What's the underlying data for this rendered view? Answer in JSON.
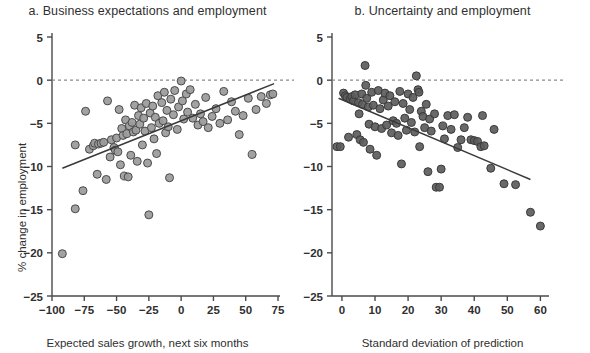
{
  "figure": {
    "background": "#ffffff",
    "panels": [
      {
        "key": "a",
        "title": "a. Business expectations and employment",
        "xlabel": "Expected sales growth, next six months",
        "ylabel": "% change in employment",
        "point_fill": "#9a9a9a",
        "point_stroke": "#4a4a4a",
        "line_color": "#3a3a3a",
        "zero_line_color": "#8a8a8a"
      },
      {
        "key": "b",
        "title": "b. Uncertainty and employment",
        "xlabel": "Standard deviation of prediction",
        "ylabel": "% change in employment",
        "point_fill": "#5c5c5c",
        "point_stroke": "#3a3a3a",
        "line_color": "#3a3a3a",
        "zero_line_color": "#8a8a8a"
      }
    ]
  },
  "chart_data": [
    {
      "type": "scatter",
      "panel": "a",
      "title": "a. Business expectations and employment",
      "xlabel": "Expected sales growth, next six months",
      "ylabel": "% change in employment",
      "xlim": [
        -100,
        75
      ],
      "ylim": [
        -25,
        5
      ],
      "xticks": [
        -100,
        -75,
        -50,
        -25,
        0,
        25,
        50,
        75
      ],
      "yticks": [
        5,
        0,
        -5,
        -10,
        -15,
        -20,
        -25
      ],
      "xticklabels": [
        "-100",
        "-75",
        "-50",
        "-25",
        "0",
        "25",
        "50",
        "75"
      ],
      "yticklabels": [
        "5",
        "0",
        "-5",
        "-10",
        "-15",
        "-20",
        "-25"
      ],
      "grid": false,
      "legend": null,
      "zero_reference_line": {
        "y": 0,
        "style": "dashed"
      },
      "trend_line": {
        "x": [
          -92,
          72
        ],
        "y": [
          -10.2,
          -0.4
        ],
        "style": "solid"
      },
      "points": [
        {
          "x": -92,
          "y": -20.1
        },
        {
          "x": -82,
          "y": -14.9
        },
        {
          "x": -82,
          "y": -7.5
        },
        {
          "x": -76,
          "y": -12.8
        },
        {
          "x": -74,
          "y": -3.6
        },
        {
          "x": -71,
          "y": -8.0
        },
        {
          "x": -68,
          "y": -7.6
        },
        {
          "x": -67,
          "y": -7.3
        },
        {
          "x": -65,
          "y": -10.9
        },
        {
          "x": -64,
          "y": -7.4
        },
        {
          "x": -62,
          "y": -7.3
        },
        {
          "x": -60,
          "y": -7.2
        },
        {
          "x": -58,
          "y": -11.5
        },
        {
          "x": -57,
          "y": -2.4
        },
        {
          "x": -55,
          "y": -8.9
        },
        {
          "x": -54,
          "y": -6.9
        },
        {
          "x": -52,
          "y": -7.8
        },
        {
          "x": -51,
          "y": -8.1
        },
        {
          "x": -50,
          "y": -6.7
        },
        {
          "x": -49,
          "y": -8.3
        },
        {
          "x": -48,
          "y": -3.4
        },
        {
          "x": -47,
          "y": -9.8
        },
        {
          "x": -46,
          "y": -5.6
        },
        {
          "x": -45,
          "y": -6.4
        },
        {
          "x": -44,
          "y": -11.1
        },
        {
          "x": -43,
          "y": -4.6
        },
        {
          "x": -42,
          "y": -6.2
        },
        {
          "x": -41,
          "y": -11.2
        },
        {
          "x": -40,
          "y": -5.3
        },
        {
          "x": -39,
          "y": -8.7
        },
        {
          "x": -38,
          "y": -4.9
        },
        {
          "x": -37,
          "y": -6.0
        },
        {
          "x": -36,
          "y": -2.9
        },
        {
          "x": -35,
          "y": -5.8
        },
        {
          "x": -34,
          "y": -9.4
        },
        {
          "x": -33,
          "y": -4.1
        },
        {
          "x": -32,
          "y": -5.1
        },
        {
          "x": -31,
          "y": -3.2
        },
        {
          "x": -30,
          "y": -7.5
        },
        {
          "x": -29,
          "y": -4.4
        },
        {
          "x": -28,
          "y": -5.9
        },
        {
          "x": -27,
          "y": -2.7
        },
        {
          "x": -26,
          "y": -9.6
        },
        {
          "x": -25,
          "y": -15.6
        },
        {
          "x": -24,
          "y": -3.8
        },
        {
          "x": -23,
          "y": -5.5
        },
        {
          "x": -22,
          "y": -3.0
        },
        {
          "x": -21,
          "y": -6.8
        },
        {
          "x": -20,
          "y": -4.3
        },
        {
          "x": -19,
          "y": -8.5
        },
        {
          "x": -18,
          "y": -1.8
        },
        {
          "x": -17,
          "y": -5.0
        },
        {
          "x": -15,
          "y": -2.6
        },
        {
          "x": -14,
          "y": -4.7
        },
        {
          "x": -13,
          "y": -1.4
        },
        {
          "x": -12,
          "y": -6.1
        },
        {
          "x": -11,
          "y": -3.5
        },
        {
          "x": -10,
          "y": -5.4
        },
        {
          "x": -9,
          "y": -11.3
        },
        {
          "x": -8,
          "y": -2.2
        },
        {
          "x": -6,
          "y": -4.0
        },
        {
          "x": -5,
          "y": -1.2
        },
        {
          "x": -3,
          "y": -5.7
        },
        {
          "x": -2,
          "y": -3.1
        },
        {
          "x": 0,
          "y": -0.1
        },
        {
          "x": 1,
          "y": -2.4
        },
        {
          "x": 2,
          "y": -4.5
        },
        {
          "x": 4,
          "y": -1.6
        },
        {
          "x": 5,
          "y": -3.7
        },
        {
          "x": 7,
          "y": -1.1
        },
        {
          "x": 9,
          "y": -4.4
        },
        {
          "x": 11,
          "y": -2.8
        },
        {
          "x": 13,
          "y": -5.2
        },
        {
          "x": 15,
          "y": -3.9
        },
        {
          "x": 17,
          "y": -4.8
        },
        {
          "x": 19,
          "y": -2.0
        },
        {
          "x": 21,
          "y": -5.5
        },
        {
          "x": 24,
          "y": -4.2
        },
        {
          "x": 27,
          "y": -3.3
        },
        {
          "x": 30,
          "y": -5.0
        },
        {
          "x": 33,
          "y": -1.3
        },
        {
          "x": 36,
          "y": -4.6
        },
        {
          "x": 39,
          "y": -2.5
        },
        {
          "x": 42,
          "y": -3.6
        },
        {
          "x": 45,
          "y": -6.3
        },
        {
          "x": 48,
          "y": -4.1
        },
        {
          "x": 52,
          "y": -2.1
        },
        {
          "x": 55,
          "y": -8.6
        },
        {
          "x": 58,
          "y": -3.4
        },
        {
          "x": 62,
          "y": -1.9
        },
        {
          "x": 66,
          "y": -2.7
        },
        {
          "x": 69,
          "y": -1.7
        },
        {
          "x": 71,
          "y": -1.6
        }
      ]
    },
    {
      "type": "scatter",
      "panel": "b",
      "title": "b. Uncertainty and employment",
      "xlabel": "Standard deviation of prediction",
      "ylabel": "% change in employment",
      "xlim": [
        -3,
        62
      ],
      "ylim": [
        -25,
        5
      ],
      "xticks": [
        0,
        10,
        20,
        30,
        40,
        50,
        60
      ],
      "yticks": [
        5,
        0,
        -5,
        -10,
        -15,
        -20,
        -25
      ],
      "xticklabels": [
        "0",
        "10",
        "20",
        "30",
        "40",
        "50",
        "60"
      ],
      "yticklabels": [
        "5",
        "0",
        "-5",
        "-10",
        "-15",
        "-20",
        "-25"
      ],
      "grid": false,
      "legend": null,
      "zero_reference_line": {
        "y": 0,
        "style": "dashed"
      },
      "trend_line": {
        "x": [
          -1,
          57
        ],
        "y": [
          -2.1,
          -11.5
        ],
        "style": "solid"
      },
      "points": [
        {
          "x": -1.5,
          "y": -7.7
        },
        {
          "x": -0.5,
          "y": -7.7
        },
        {
          "x": 0.5,
          "y": -1.5
        },
        {
          "x": 1.0,
          "y": -1.8
        },
        {
          "x": 1.5,
          "y": -2.0
        },
        {
          "x": 2.0,
          "y": -6.6
        },
        {
          "x": 2.5,
          "y": -2.2
        },
        {
          "x": 3.0,
          "y": -1.9
        },
        {
          "x": 3.5,
          "y": -2.4
        },
        {
          "x": 4.0,
          "y": -1.7
        },
        {
          "x": 4.5,
          "y": -6.3
        },
        {
          "x": 5.0,
          "y": -2.6
        },
        {
          "x": 5.2,
          "y": -3.9
        },
        {
          "x": 5.5,
          "y": -6.9
        },
        {
          "x": 6.0,
          "y": -1.6
        },
        {
          "x": 6.2,
          "y": -2.8
        },
        {
          "x": 6.5,
          "y": -7.2
        },
        {
          "x": 7.0,
          "y": 1.7
        },
        {
          "x": 7.2,
          "y": -0.6
        },
        {
          "x": 7.5,
          "y": -2.1
        },
        {
          "x": 8.0,
          "y": -3.1
        },
        {
          "x": 8.2,
          "y": -5.1
        },
        {
          "x": 8.5,
          "y": -8.0
        },
        {
          "x": 9.0,
          "y": -1.4
        },
        {
          "x": 9.5,
          "y": -2.9
        },
        {
          "x": 10.0,
          "y": -5.4
        },
        {
          "x": 10.5,
          "y": -8.7
        },
        {
          "x": 11.0,
          "y": -1.2
        },
        {
          "x": 11.5,
          "y": -3.3
        },
        {
          "x": 12.0,
          "y": -5.6
        },
        {
          "x": 12.5,
          "y": -2.3
        },
        {
          "x": 13.0,
          "y": -1.5
        },
        {
          "x": 13.5,
          "y": -5.2
        },
        {
          "x": 14.0,
          "y": -3.0
        },
        {
          "x": 14.5,
          "y": -1.8
        },
        {
          "x": 15.0,
          "y": -6.1
        },
        {
          "x": 15.5,
          "y": -4.7
        },
        {
          "x": 16.0,
          "y": -2.5
        },
        {
          "x": 16.5,
          "y": -5.0
        },
        {
          "x": 17.0,
          "y": -6.4
        },
        {
          "x": 17.5,
          "y": -1.3
        },
        {
          "x": 18.0,
          "y": -9.7
        },
        {
          "x": 18.5,
          "y": -2.7
        },
        {
          "x": 19.0,
          "y": -4.4
        },
        {
          "x": 19.5,
          "y": -5.8
        },
        {
          "x": 20.0,
          "y": -1.6
        },
        {
          "x": 20.5,
          "y": -3.4
        },
        {
          "x": 21.0,
          "y": -4.9
        },
        {
          "x": 21.5,
          "y": -2.0
        },
        {
          "x": 22.0,
          "y": -6.0
        },
        {
          "x": 22.5,
          "y": 0.5
        },
        {
          "x": 23.0,
          "y": -1.1
        },
        {
          "x": 23.3,
          "y": -1.4
        },
        {
          "x": 23.5,
          "y": -7.7
        },
        {
          "x": 24.0,
          "y": -3.6
        },
        {
          "x": 24.5,
          "y": -4.2
        },
        {
          "x": 25.0,
          "y": -5.5
        },
        {
          "x": 25.5,
          "y": -2.8
        },
        {
          "x": 26.0,
          "y": -10.6
        },
        {
          "x": 26.5,
          "y": -4.5
        },
        {
          "x": 27.0,
          "y": -5.9
        },
        {
          "x": 28.0,
          "y": -3.9
        },
        {
          "x": 28.5,
          "y": -12.4
        },
        {
          "x": 29.5,
          "y": -12.4
        },
        {
          "x": 30.0,
          "y": -10.3
        },
        {
          "x": 30.5,
          "y": -5.3
        },
        {
          "x": 31.0,
          "y": -6.8
        },
        {
          "x": 32.0,
          "y": -4.1
        },
        {
          "x": 33.0,
          "y": -5.7
        },
        {
          "x": 34.0,
          "y": -4.0
        },
        {
          "x": 35.0,
          "y": -7.8
        },
        {
          "x": 36.0,
          "y": -6.9
        },
        {
          "x": 37.0,
          "y": -5.5
        },
        {
          "x": 38.0,
          "y": -4.3
        },
        {
          "x": 39.0,
          "y": -6.9
        },
        {
          "x": 40.0,
          "y": -7.0
        },
        {
          "x": 41.0,
          "y": -7.1
        },
        {
          "x": 42.0,
          "y": -7.7
        },
        {
          "x": 42.5,
          "y": -4.1
        },
        {
          "x": 43.0,
          "y": -7.6
        },
        {
          "x": 45.0,
          "y": -10.2
        },
        {
          "x": 46.0,
          "y": -5.7
        },
        {
          "x": 49.0,
          "y": -12.0
        },
        {
          "x": 52.5,
          "y": -12.1
        },
        {
          "x": 57.0,
          "y": -15.3
        },
        {
          "x": 60.0,
          "y": -16.9
        }
      ]
    }
  ]
}
